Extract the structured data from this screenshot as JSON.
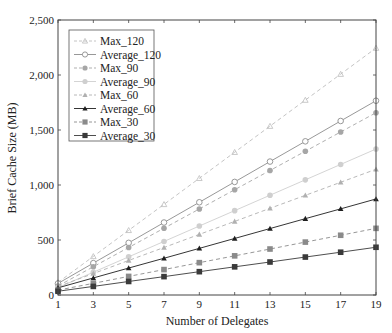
{
  "chart_data": {
    "type": "line",
    "title": "",
    "xlabel": "Number of Delegates",
    "ylabel": "Brief Cache Size (MB)",
    "x": [
      1,
      3,
      5,
      7,
      9,
      11,
      13,
      15,
      17,
      19
    ],
    "xticks": [
      "1",
      "3",
      "5",
      "7",
      "9",
      "11",
      "13",
      "15",
      "17",
      "19"
    ],
    "xlim": [
      1,
      19
    ],
    "ylim": [
      0,
      2500
    ],
    "yticks": [
      0,
      500,
      1000,
      1500,
      2000,
      2500
    ],
    "ytick_labels": [
      "0",
      "500",
      "1,000",
      "1,500",
      "2,000",
      "2,500"
    ],
    "grid": false,
    "legend_position": "upper left",
    "series": [
      {
        "name": "Max_120",
        "values": [
          114,
          351,
          588,
          824,
          1061,
          1298,
          1535,
          1772,
          2008,
          2245
        ],
        "color": "#bdbdbd",
        "dash": true,
        "marker": "star"
      },
      {
        "name": "Average_120",
        "values": [
          105,
          290,
          474,
          659,
          843,
          1028,
          1213,
          1397,
          1582,
          1766
        ],
        "color": "#8c8c8c",
        "dash": false,
        "marker": "open-circle"
      },
      {
        "name": "Max_90",
        "values": [
          82,
          257,
          432,
          607,
          782,
          957,
          1132,
          1307,
          1482,
          1657
        ],
        "color": "#a6a6a6",
        "dash": true,
        "marker": "circle"
      },
      {
        "name": "Average_90",
        "values": [
          67,
          207,
          347,
          487,
          627,
          767,
          907,
          1047,
          1187,
          1327
        ],
        "color": "#cfcfcf",
        "dash": false,
        "marker": "circle"
      },
      {
        "name": "Max_60",
        "values": [
          77,
          195,
          314,
          432,
          551,
          669,
          788,
          906,
          1025,
          1143
        ],
        "color": "#b0b0b0",
        "dash": true,
        "marker": "triangle"
      },
      {
        "name": "Average_60",
        "values": [
          65,
          155,
          245,
          334,
          424,
          514,
          604,
          694,
          783,
          873
        ],
        "color": "#1e1e1e",
        "dash": false,
        "marker": "triangle"
      },
      {
        "name": "Max_30",
        "values": [
          44,
          106,
          169,
          231,
          294,
          356,
          418,
          481,
          543,
          606
        ],
        "color": "#8a8a8a",
        "dash": true,
        "marker": "square"
      },
      {
        "name": "Average_30",
        "values": [
          34,
          78,
          123,
          167,
          212,
          256,
          300,
          345,
          389,
          434
        ],
        "color": "#3a3a3a",
        "dash": false,
        "marker": "square"
      }
    ]
  }
}
